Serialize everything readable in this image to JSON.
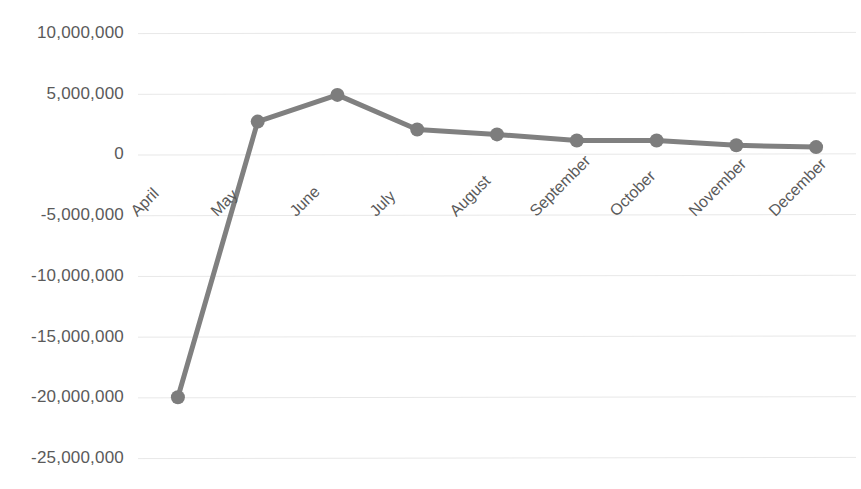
{
  "chart_data": {
    "type": "line",
    "title": "",
    "subtitle": "",
    "xlabel": "",
    "ylabel": "",
    "categories": [
      "April",
      "May",
      "June",
      "July",
      "August",
      "September",
      "October",
      "November",
      "December"
    ],
    "values": [
      -20000000,
      2700000,
      4900000,
      2050000,
      1650000,
      1150000,
      1150000,
      750000,
      600000
    ],
    "series": [
      {
        "name": "",
        "values": [
          -20000000,
          2700000,
          4900000,
          2050000,
          1650000,
          1150000,
          1150000,
          750000,
          600000
        ]
      }
    ],
    "ylim": [
      -25000000,
      10000000
    ],
    "ytick_values": [
      10000000,
      5000000,
      0,
      -5000000,
      -10000000,
      -15000000,
      -20000000,
      -25000000
    ],
    "ytick_labels": [
      "10,000,000",
      "5,000,000",
      "0",
      "-5,000,000",
      "-10,000,000",
      "-15,000,000",
      "-20,000,000",
      "-25,000,000"
    ],
    "grid": true,
    "grid_axis": "y",
    "legend": "none",
    "marker": "circle",
    "xtick_rotation": -45
  },
  "style": {
    "series_color": "#808080",
    "marker_color": "#7d7d7d",
    "grid_color": "#e8e8e8",
    "tick_label_color": "#5a5a5a",
    "background": "#ffffff",
    "line_width": 5,
    "marker_radius": 7
  },
  "axis": {
    "plot_left": 138,
    "plot_right": 856,
    "y_top_value": 10000000,
    "y_bottom_value": -25000000,
    "y_top_px": 33,
    "y_bottom_px": 458
  }
}
